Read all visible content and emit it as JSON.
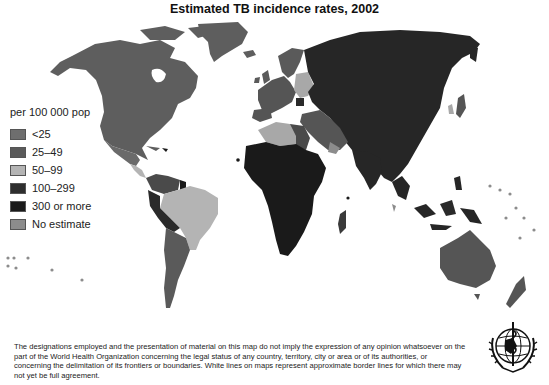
{
  "title": "Estimated TB incidence rates, 2002",
  "legend": {
    "title": "per 100 000 pop",
    "items": [
      {
        "label": "<25",
        "color": "#6e6e6e"
      },
      {
        "label": "25–49",
        "color": "#5a5a5a"
      },
      {
        "label": "50–99",
        "color": "#b4b4b4"
      },
      {
        "label": "100–299",
        "color": "#2e2e2e"
      },
      {
        "label": "300 or more",
        "color": "#1a1a1a"
      },
      {
        "label": "No estimate",
        "color": "#8c8c8c"
      }
    ]
  },
  "map_regions": [
    {
      "region": "North America (Canada, USA)",
      "category": "<25"
    },
    {
      "region": "Greenland",
      "category": "<25"
    },
    {
      "region": "Mexico",
      "category": "25–49"
    },
    {
      "region": "Central America",
      "category": "50–99"
    },
    {
      "region": "Brazil",
      "category": "50–99"
    },
    {
      "region": "Peru / Bolivia",
      "category": "100–299"
    },
    {
      "region": "Argentina / Chile",
      "category": "25–49"
    },
    {
      "region": "Western Europe",
      "category": "<25"
    },
    {
      "region": "Eastern Europe (Ukraine, Belarus)",
      "category": "50–99"
    },
    {
      "region": "Russia / Central Asia / China",
      "category": "100–299"
    },
    {
      "region": "North Africa (Algeria, Libya)",
      "category": "50–99"
    },
    {
      "region": "Sub-Saharan Africa",
      "category": "300 or more"
    },
    {
      "region": "Middle East",
      "category": "25–49"
    },
    {
      "region": "India / South-East Asia",
      "category": "100–299"
    },
    {
      "region": "Japan",
      "category": "25–49"
    },
    {
      "region": "Australia",
      "category": "<25"
    },
    {
      "region": "New Zealand",
      "category": "<25"
    }
  ],
  "disclaimer": "The designations employed and the presentation of material on this map do not imply the expression of any opinion whatsoever on the part of the World Health Organization concerning the legal status of any country, territory, city or area or of its authorities, or concerning the delimitation of its frontiers or boundaries. White lines on maps represent approximate border lines for which there may not yet be full agreement.",
  "emblem": "who-emblem-icon"
}
